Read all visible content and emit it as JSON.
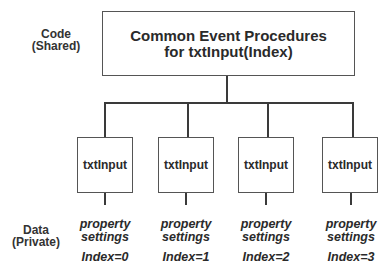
{
  "labels": {
    "code": "Code",
    "code_sub": "(Shared)",
    "data": "Data",
    "data_sub": "(Private)"
  },
  "top_box": {
    "line1": "Common Event Procedures",
    "line2": "for txtInput(Index)"
  },
  "controls": [
    {
      "name": "txtInput",
      "prop_line1": "property",
      "prop_line2": "settings",
      "index": "Index=0"
    },
    {
      "name": "txtInput",
      "prop_line1": "property",
      "prop_line2": "settings",
      "index": "Index=1"
    },
    {
      "name": "txtInput",
      "prop_line1": "property",
      "prop_line2": "settings",
      "index": "Index=2"
    },
    {
      "name": "txtInput",
      "prop_line1": "property",
      "prop_line2": "settings",
      "index": "Index=3"
    }
  ],
  "colors": {
    "line": "#3a3a3a",
    "border": "#555555",
    "text": "#2a2a2a"
  }
}
